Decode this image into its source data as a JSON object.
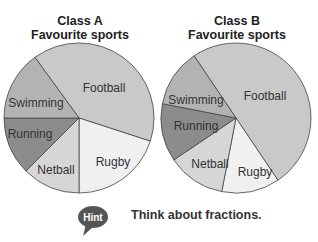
{
  "charts": {
    "a": {
      "title_line1": "Class A",
      "title_line2": "Favourite sports"
    },
    "b": {
      "title_line1": "Class B",
      "title_line2": "Favourite sports"
    }
  },
  "hint": {
    "badge": "Hint",
    "text": "Think about fractions."
  },
  "colors": {
    "football": "#c9c9c9",
    "rugby": "#f0f0f0",
    "netball": "#d6d6d6",
    "running": "#8c8c8c",
    "swimming": "#b3b3b3",
    "outline": "#444444",
    "hint_bubble": "#555555"
  },
  "chart_data": [
    {
      "type": "pie",
      "title": "Class A Favourite sports",
      "categories": [
        "Football",
        "Rugby",
        "Netball",
        "Running",
        "Swimming"
      ],
      "values": [
        40,
        20,
        12.5,
        12.5,
        15
      ],
      "unit": "percent (estimated from slice angles)",
      "legend": "labels inside slices"
    },
    {
      "type": "pie",
      "title": "Class B Favourite sports",
      "categories": [
        "Football",
        "Rugby",
        "Netball",
        "Running",
        "Swimming"
      ],
      "values": [
        50,
        12.5,
        12.5,
        12.5,
        12.5
      ],
      "unit": "percent (estimated from slice angles)",
      "legend": "labels inside slices"
    }
  ]
}
